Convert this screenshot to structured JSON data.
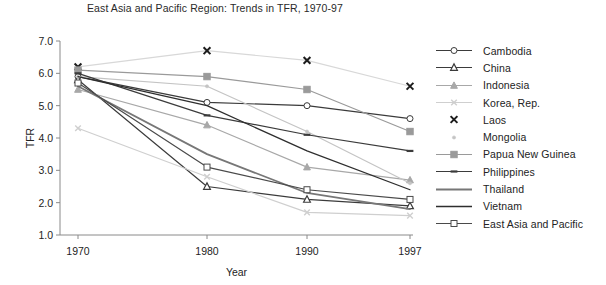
{
  "chart_data": {
    "type": "line",
    "title": "East Asia and Pacific Region: Trends in TFR, 1970-97",
    "xlabel": "Year",
    "ylabel": "TFR",
    "x": [
      1970,
      1980,
      1990,
      1997
    ],
    "xtick_labels": [
      "1970",
      "1980",
      "1990",
      "1997"
    ],
    "ytick_labels": [
      "1.0",
      "2.0",
      "3.0",
      "4.0",
      "5.0",
      "6.0",
      "7.0"
    ],
    "ylim": [
      1.0,
      7.0
    ],
    "xlim": [
      1968,
      1997
    ],
    "grid": false,
    "legend_position": "right",
    "series": [
      {
        "name": "Cambodia",
        "values": [
          5.9,
          5.1,
          5.0,
          4.6
        ],
        "marker": "circle-open",
        "color": "#3b3b3b"
      },
      {
        "name": "China",
        "values": [
          5.8,
          2.5,
          2.1,
          1.9
        ],
        "marker": "triangle",
        "color": "#3b3b3b"
      },
      {
        "name": "Indonesia",
        "values": [
          5.5,
          4.4,
          3.1,
          2.7
        ],
        "marker": "triangle-gray",
        "color": "#a8a8a8"
      },
      {
        "name": "Korea, Rep.",
        "values": [
          4.3,
          2.8,
          1.7,
          1.6
        ],
        "marker": "x-gray",
        "color": "#cfcfcf"
      },
      {
        "name": "Laos",
        "values": [
          6.2,
          6.7,
          6.4,
          5.6
        ],
        "marker": "x-bold",
        "color": "#d8d8d8"
      },
      {
        "name": "Mongolia",
        "values": [
          5.9,
          5.6,
          4.2,
          2.6
        ],
        "marker": "dot",
        "color": "#c4c4c4"
      },
      {
        "name": "Papua New Guinea",
        "values": [
          6.1,
          5.9,
          5.5,
          4.2
        ],
        "marker": "square-gray",
        "color": "#9a9a9a"
      },
      {
        "name": "Philippines",
        "values": [
          6.0,
          4.7,
          4.1,
          3.6
        ],
        "marker": "dash",
        "color": "#3b3b3b"
      },
      {
        "name": "Thailand",
        "values": [
          5.6,
          3.5,
          2.3,
          1.8
        ],
        "marker": "line-thick",
        "color": "#777777"
      },
      {
        "name": "Vietnam",
        "values": [
          5.9,
          5.0,
          3.6,
          2.4
        ],
        "marker": "line-plain",
        "color": "#2e2e2e"
      },
      {
        "name": "East Asia and Pacific",
        "values": [
          5.7,
          3.1,
          2.4,
          2.1
        ],
        "marker": "square-open",
        "color": "#4a4a4a"
      }
    ]
  },
  "colors": {
    "axis": "#8a8a8a",
    "text": "#232323",
    "background": "#ffffff"
  }
}
